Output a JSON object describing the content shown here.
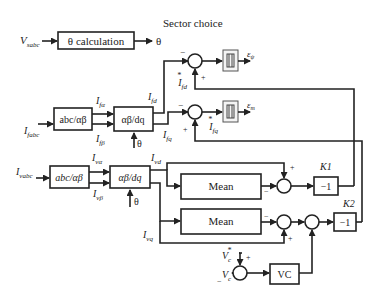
{
  "title": "Sector choice",
  "blocks": {
    "theta_calc": "θ calculation",
    "abc_ab_f": "abc/αβ",
    "ab_dq_f": "αβ/dq",
    "abc_ab_v": "abc/αβ",
    "ab_dq_v": "αβ/dq",
    "mean1": "Mean",
    "mean2": "Mean",
    "k1": "−1",
    "k2": "−1",
    "vc": "VC"
  },
  "signals": {
    "v_sabc": "V",
    "v_sabc_sub": "sabc",
    "theta": "θ",
    "i_fabc": "I",
    "i_fabc_sub": "fabc",
    "i_fa": "I",
    "i_fa_sub": "fα",
    "i_fb": "I",
    "i_fb_sub": "fβ",
    "i_fd": "I",
    "i_fd_sub": "fd",
    "i_fq": "I",
    "i_fq_sub": "fq",
    "i_fd_ref": "I",
    "i_fd_ref_sub": "fd",
    "i_fq_ref": "I",
    "i_fq_ref_sub": "fq",
    "e_psi": "ε",
    "e_psi_sub": "ψ",
    "e_m": "ε",
    "e_m_sub": "m",
    "i_vabc": "I",
    "i_vabc_sub": "vabc",
    "i_va": "I",
    "i_va_sub": "vα",
    "i_vb": "I",
    "i_vb_sub": "vβ",
    "i_vd": "I",
    "i_vd_sub": "vd",
    "i_vq": "I",
    "i_vq_sub": "vq",
    "vc_ref": "V",
    "vc_ref_sub": "c",
    "vc": "V",
    "vc_sub": "c",
    "star": "*"
  },
  "gains": {
    "k1_label": "K1",
    "k2_label": "K2"
  },
  "signs": {
    "plus": "+",
    "minus": "−"
  }
}
